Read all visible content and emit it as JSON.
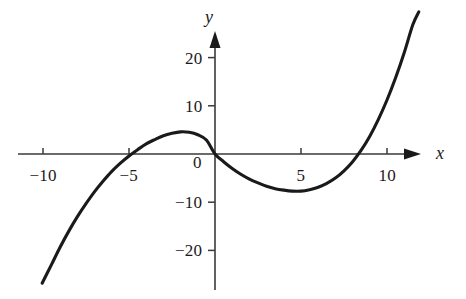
{
  "figure": {
    "width": 466,
    "height": 299,
    "background": "#ffffff",
    "curve_color": "#1a1a1a",
    "axis_color": "#3a3a3a"
  },
  "axes": {
    "x_name": "x",
    "y_name": "y",
    "x_ticks": [
      {
        "label": "−10",
        "value": -10
      },
      {
        "label": "−5",
        "value": -5
      },
      {
        "label": "5",
        "value": 5
      },
      {
        "label": "10",
        "value": 10
      }
    ],
    "y_ticks": [
      {
        "label": "20",
        "value": 20
      },
      {
        "label": "10",
        "value": 10
      },
      {
        "label": "0",
        "value": 0
      },
      {
        "label": "−10",
        "value": -10
      },
      {
        "label": "−20",
        "value": -20
      }
    ],
    "origin_label": "0"
  },
  "chart_data": {
    "type": "line",
    "title": "",
    "subtitle": "",
    "xlabel": "x",
    "ylabel": "y",
    "xlim": [
      -11.5,
      12.5
    ],
    "ylim": [
      -29,
      25
    ],
    "grid": false,
    "legend": null,
    "x_ticks": [
      -10,
      -5,
      5,
      10
    ],
    "y_ticks": [
      -20,
      -10,
      0,
      10,
      20
    ],
    "series": [
      {
        "name": "cubic curve",
        "x": [
          -10.05,
          -9.5,
          -9.0,
          -8.5,
          -8.0,
          -7.5,
          -7.0,
          -6.5,
          -6.0,
          -5.5,
          -5.0,
          -4.5,
          -4.0,
          -3.5,
          -3.0,
          -2.5,
          -2.0,
          -1.5,
          -1.0,
          -0.5,
          0.0,
          0.5,
          1.0,
          1.5,
          2.0,
          2.5,
          3.0,
          3.5,
          4.0,
          4.5,
          5.0,
          5.5,
          6.0,
          6.5,
          7.0,
          7.5,
          8.0,
          8.5,
          9.0,
          9.5,
          10.0,
          10.5,
          11.0,
          11.5,
          11.85
        ],
        "y": [
          -26.8,
          -22.9,
          -19.3,
          -16.0,
          -13.0,
          -10.3,
          -7.8,
          -5.6,
          -3.6,
          -1.9,
          -0.4,
          0.9,
          2.1,
          3.0,
          3.8,
          4.3,
          4.6,
          4.5,
          4.0,
          2.9,
          0.0,
          -1.6,
          -3.0,
          -4.2,
          -5.2,
          -6.0,
          -6.7,
          -7.2,
          -7.5,
          -7.7,
          -7.7,
          -7.4,
          -6.9,
          -6.1,
          -5.0,
          -3.5,
          -1.6,
          0.8,
          3.7,
          7.2,
          11.2,
          15.8,
          21.0,
          26.8,
          29.5
        ],
        "key_points": {
          "x_intercepts": [
            -6.4,
            0.0,
            8.7
          ],
          "local_maximum": {
            "x": -3.2,
            "y": 5.0
          },
          "local_minimum": {
            "x": 5.1,
            "y": -7.6
          },
          "left_endpoint": {
            "x": -10.0,
            "y": -27.0
          },
          "right_endpoint": {
            "x": 11.8,
            "y": 23.5
          }
        }
      }
    ]
  }
}
